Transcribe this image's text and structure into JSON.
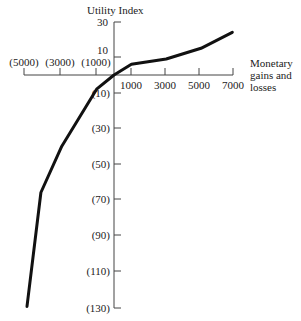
{
  "chart_data": {
    "type": "line",
    "title": "",
    "ylabel": "Utility Index",
    "xlabel": [
      "Monetary",
      "gains and",
      "losses"
    ],
    "x_ticks_negative": [
      "(5000)",
      "(3000)",
      "(1000)"
    ],
    "x_ticks_positive": [
      "1000",
      "3000",
      "5000",
      "7000"
    ],
    "y_ticks_positive": [
      "30",
      "10"
    ],
    "y_ticks_negative": [
      "(10)",
      "(30)",
      "(50)",
      "(70)",
      "(90)",
      "(110)",
      "(130)"
    ],
    "xlim": [
      -5000,
      7000
    ],
    "ylim": [
      -130,
      30
    ],
    "grid": false,
    "series": [
      {
        "name": "Utility curve",
        "x": [
          -5000,
          -4200,
          -3000,
          -1000,
          0,
          1000,
          3000,
          5000,
          6800
        ],
        "y": [
          -130,
          -66,
          -40,
          -8,
          0,
          6,
          9,
          15,
          24
        ]
      }
    ],
    "line_color": "#111111"
  }
}
